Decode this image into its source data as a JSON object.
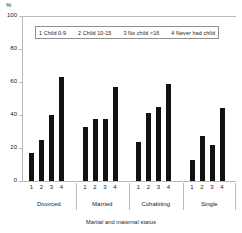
{
  "chart_data": {
    "type": "bar",
    "title": "",
    "xlabel": "Marital and maternal status",
    "ylabel": "%",
    "ylim": [
      0,
      100
    ],
    "yticks": [
      0,
      20,
      40,
      60,
      80,
      100
    ],
    "grid": false,
    "legend_position": "top-inside",
    "categories": [
      "Divorced",
      "Married",
      "Cohabiting",
      "Single"
    ],
    "subcategories": [
      "1",
      "2",
      "3",
      "4"
    ],
    "legend": [
      "1 Child 0-9",
      "2 Child 10-15",
      "3 No child <16",
      "4 Never had child"
    ],
    "series": [
      {
        "name": "1 Child 0-9",
        "values": [
          17.0,
          33.0,
          23.5,
          12.5
        ]
      },
      {
        "name": "2 Child 10-15",
        "values": [
          25.0,
          37.5,
          41.5,
          27.0
        ]
      },
      {
        "name": "3 No child <16",
        "values": [
          40.0,
          37.5,
          45.0,
          22.0
        ]
      },
      {
        "name": "4 Never had child",
        "values": [
          63.0,
          57.0,
          58.5,
          44.0
        ]
      }
    ],
    "groups": [
      {
        "label": "Divorced",
        "bars": [
          {
            "key": "1",
            "value": 17.0
          },
          {
            "key": "2",
            "value": 25.0
          },
          {
            "key": "3",
            "value": 40.0
          },
          {
            "key": "4",
            "value": 63.0
          }
        ]
      },
      {
        "label": "Married",
        "bars": [
          {
            "key": "1",
            "value": 33.0
          },
          {
            "key": "2",
            "value": 37.5
          },
          {
            "key": "3",
            "value": 37.5
          },
          {
            "key": "4",
            "value": 57.0
          }
        ]
      },
      {
        "label": "Cohabiting",
        "bars": [
          {
            "key": "1",
            "value": 23.5
          },
          {
            "key": "2",
            "value": 41.5
          },
          {
            "key": "3",
            "value": 45.0
          },
          {
            "key": "4",
            "value": 58.5
          }
        ]
      },
      {
        "label": "Single",
        "bars": [
          {
            "key": "1",
            "value": 12.5
          },
          {
            "key": "2",
            "value": 27.0
          },
          {
            "key": "3",
            "value": 22.0
          },
          {
            "key": "4",
            "value": 44.0
          }
        ]
      }
    ],
    "colors": {
      "bar": "#121212",
      "axis": "#b9b9b9",
      "text": "#1a1a1a",
      "legend_border": "#8f8f8f",
      "background": "#ffffff"
    }
  }
}
